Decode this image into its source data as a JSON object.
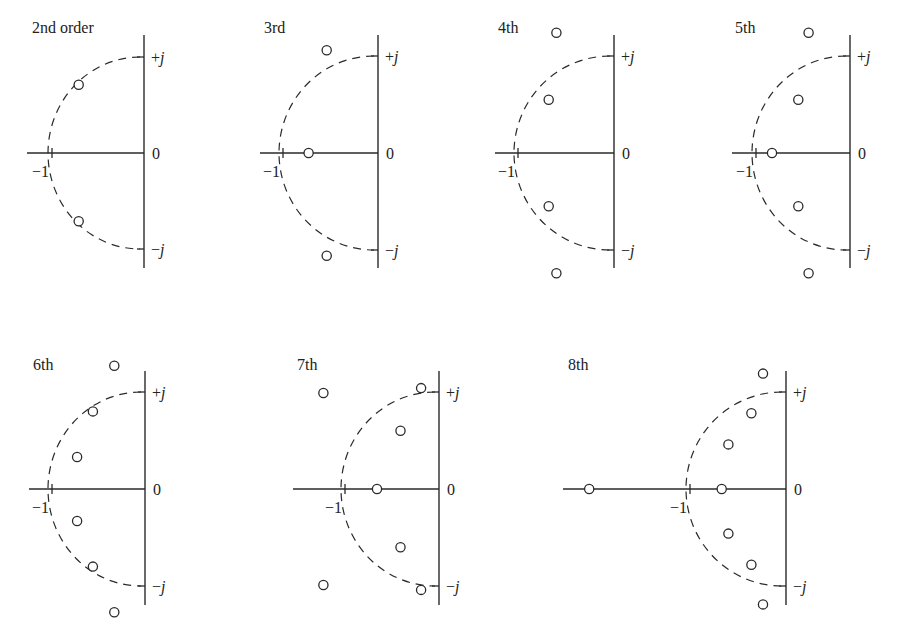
{
  "labels": {
    "plus_j": {
      "sign": "+",
      "symbol": "j"
    },
    "minus_j": {
      "sign": "−",
      "symbol": "j"
    },
    "zero": "0",
    "minus_one": "−1"
  },
  "chart_data": {
    "type": "scatter",
    "title": "",
    "xlabel": "Real axis (σ)",
    "ylabel": "Imaginary axis (jω)",
    "grid": false,
    "reference_curve": "dashed unit semicircle in left half-plane from +j through −1 to −j",
    "marker": "open circle",
    "panels": [
      {
        "title": "2nd order",
        "order": 2,
        "poles": [
          [
            -0.71,
            0.71
          ],
          [
            -0.71,
            -0.71
          ]
        ]
      },
      {
        "title": "3rd",
        "order": 3,
        "poles": [
          [
            -0.54,
            1.06
          ],
          [
            -0.73,
            0.0
          ],
          [
            -0.54,
            -1.06
          ]
        ]
      },
      {
        "title": "4th",
        "order": 4,
        "poles": [
          [
            -0.6,
            1.24
          ],
          [
            -0.68,
            0.55
          ],
          [
            -0.68,
            -0.55
          ],
          [
            -0.6,
            -1.24
          ]
        ]
      },
      {
        "title": "5th",
        "order": 5,
        "poles": [
          [
            -0.44,
            1.24
          ],
          [
            -0.55,
            0.55
          ],
          [
            -0.83,
            0.0
          ],
          [
            -0.55,
            -0.55
          ],
          [
            -0.44,
            -1.24
          ]
        ]
      },
      {
        "title": "6th",
        "order": 6,
        "poles": [
          [
            -0.33,
            1.27
          ],
          [
            -0.56,
            0.8
          ],
          [
            -0.73,
            0.33
          ],
          [
            -0.73,
            -0.33
          ],
          [
            -0.56,
            -0.8
          ],
          [
            -0.33,
            -1.27
          ]
        ]
      },
      {
        "title": "7th",
        "order": 7,
        "poles": [
          [
            -1.23,
            0.99
          ],
          [
            -0.19,
            1.04
          ],
          [
            -0.41,
            0.6
          ],
          [
            -0.66,
            0.0
          ],
          [
            -0.41,
            -0.6
          ],
          [
            -1.23,
            -0.99
          ],
          [
            -0.19,
            -1.04
          ]
        ]
      },
      {
        "title": "8th",
        "order": 8,
        "poles": [
          [
            -0.24,
            1.19
          ],
          [
            -0.36,
            0.78
          ],
          [
            -0.6,
            0.46
          ],
          [
            -0.67,
            0.0
          ],
          [
            -2.05,
            0.0
          ],
          [
            -0.6,
            -0.46
          ],
          [
            -0.36,
            -0.78
          ],
          [
            -0.24,
            -1.19
          ]
        ]
      }
    ]
  }
}
